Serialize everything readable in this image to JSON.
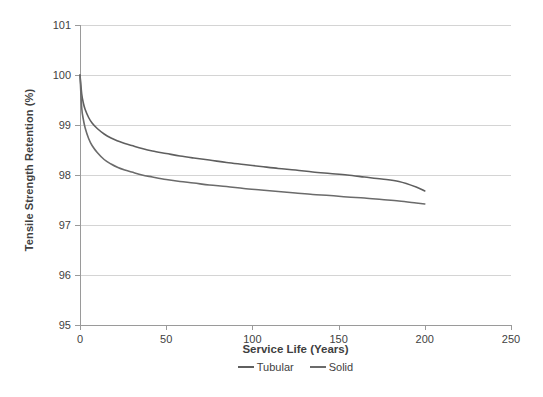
{
  "chart_data": {
    "type": "line",
    "title": "",
    "xlabel": "Service Life (Years)",
    "ylabel": "Tensile Strength Retention (%)",
    "xlim": [
      0,
      250
    ],
    "ylim": [
      95,
      101
    ],
    "xticks": [
      "0",
      "50",
      "100",
      "150",
      "200",
      "250"
    ],
    "xtick_values": [
      0,
      50,
      100,
      150,
      200,
      250
    ],
    "yticks": [
      "95",
      "96",
      "97",
      "98",
      "99",
      "100",
      "101"
    ],
    "ytick_values": [
      95,
      96,
      97,
      98,
      99,
      100,
      101
    ],
    "grid": "horizontal",
    "legend_position": "bottom",
    "colors": {
      "tubular": "#5f5f5f",
      "solid": "#6b6b6b",
      "gridline": "#d4d4d4",
      "axis": "#9a9a9a",
      "text": "#3f3f3f",
      "background": "#ffffff"
    },
    "x": [
      0,
      1,
      2,
      3,
      5,
      7,
      10,
      14,
      18,
      22,
      26,
      30,
      36,
      42,
      50,
      58,
      66,
      75,
      85,
      95,
      105,
      115,
      125,
      135,
      145,
      155,
      165,
      175,
      185,
      195,
      200
    ],
    "series": [
      {
        "name": "Tubular",
        "values": [
          100.0,
          99.62,
          99.43,
          99.31,
          99.15,
          99.04,
          98.93,
          98.82,
          98.74,
          98.68,
          98.63,
          98.59,
          98.53,
          98.48,
          98.43,
          98.38,
          98.34,
          98.3,
          98.25,
          98.21,
          98.17,
          98.13,
          98.1,
          98.06,
          98.03,
          98.0,
          97.96,
          97.92,
          97.87,
          97.76,
          97.68
        ]
      },
      {
        "name": "Solid",
        "values": [
          100.0,
          99.34,
          99.1,
          98.94,
          98.73,
          98.59,
          98.45,
          98.31,
          98.22,
          98.15,
          98.1,
          98.06,
          98.0,
          97.96,
          97.91,
          97.87,
          97.84,
          97.8,
          97.77,
          97.73,
          97.7,
          97.67,
          97.64,
          97.61,
          97.59,
          97.56,
          97.54,
          97.51,
          97.48,
          97.44,
          97.42
        ]
      }
    ]
  },
  "legend": {
    "items": [
      {
        "label": "Tubular",
        "color": "#5f5f5f"
      },
      {
        "label": "Solid",
        "color": "#6b6b6b"
      }
    ]
  }
}
